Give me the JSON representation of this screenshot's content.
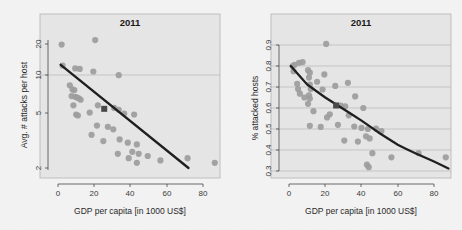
{
  "figure": {
    "background_color": "#f4f4f4",
    "panel_fill": "#e7e7e7",
    "point_color": "#9e9e9e",
    "trend_color": "#1f1f1f",
    "marker_color": "#4a4a4a",
    "grid_color": "#b9b9b9"
  },
  "chart_data": [
    {
      "id": "left",
      "type": "scatter",
      "title": "2011",
      "xlabel": "GDP per capita [in 1000 US$]",
      "ylabel": "Avg. # attacks per host",
      "xlim": [
        -4,
        92
      ],
      "ylim": [
        1.7,
        24
      ],
      "yscale": "log",
      "xscale": "linear",
      "xticks": [
        0,
        20,
        40,
        60,
        80
      ],
      "xticklabels": [
        "0",
        "20",
        "40",
        "60",
        "80"
      ],
      "yticks": [
        2,
        5,
        10,
        20
      ],
      "yticklabels": [
        "2",
        "5",
        "10",
        "20"
      ],
      "grid": "y-gridline at 10 only",
      "legend": "none",
      "points": [
        {
          "x": 2.0,
          "y": 19.8
        },
        {
          "x": 20.5,
          "y": 21.5
        },
        {
          "x": 2.5,
          "y": 13.4
        },
        {
          "x": 9.5,
          "y": 12.7
        },
        {
          "x": 12.0,
          "y": 12.6
        },
        {
          "x": 19.5,
          "y": 12.0
        },
        {
          "x": 33.5,
          "y": 11.2
        },
        {
          "x": 6.5,
          "y": 9.3
        },
        {
          "x": 8.0,
          "y": 8.6
        },
        {
          "x": 9.0,
          "y": 8.5
        },
        {
          "x": 7.5,
          "y": 7.6
        },
        {
          "x": 9.5,
          "y": 7.5
        },
        {
          "x": 10.5,
          "y": 7.4
        },
        {
          "x": 11.5,
          "y": 7.3
        },
        {
          "x": 8.5,
          "y": 6.4
        },
        {
          "x": 12.5,
          "y": 7.1
        },
        {
          "x": 10.0,
          "y": 5.4
        },
        {
          "x": 11.0,
          "y": 5.3
        },
        {
          "x": 17.5,
          "y": 5.6
        },
        {
          "x": 22.0,
          "y": 6.4
        },
        {
          "x": 31.0,
          "y": 6.1
        },
        {
          "x": 33.5,
          "y": 5.9
        },
        {
          "x": 36.5,
          "y": 5.5
        },
        {
          "x": 42.0,
          "y": 5.4
        },
        {
          "x": 21.5,
          "y": 4.4
        },
        {
          "x": 27.5,
          "y": 4.3
        },
        {
          "x": 30.5,
          "y": 4.1
        },
        {
          "x": 18.5,
          "y": 3.7
        },
        {
          "x": 25.0,
          "y": 3.3
        },
        {
          "x": 34.0,
          "y": 3.4
        },
        {
          "x": 38.5,
          "y": 3.2
        },
        {
          "x": 43.5,
          "y": 3.1
        },
        {
          "x": 41.0,
          "y": 2.7
        },
        {
          "x": 44.5,
          "y": 2.6
        },
        {
          "x": 33.0,
          "y": 2.6
        },
        {
          "x": 39.0,
          "y": 2.4
        },
        {
          "x": 43.5,
          "y": 2.2
        },
        {
          "x": 49.5,
          "y": 2.5
        },
        {
          "x": 56.5,
          "y": 2.3
        },
        {
          "x": 71.5,
          "y": 2.4
        },
        {
          "x": 86.5,
          "y": 2.2
        }
      ],
      "highlight_point": {
        "x": 25.5,
        "y": 6.0,
        "style": "filled-square"
      },
      "trend": {
        "form": "linear-on-log-y",
        "endpoints": [
          {
            "x": 1.5,
            "y": 13.6
          },
          {
            "x": 72.0,
            "y": 2.0
          }
        ]
      }
    },
    {
      "id": "right",
      "type": "scatter",
      "title": "2011",
      "xlabel": "GDP per capita [in 1000 US$]",
      "ylabel": "% attacked hosts",
      "xlim": [
        -4,
        92
      ],
      "ylim": [
        0.285,
        0.925
      ],
      "yscale": "linear",
      "xscale": "linear",
      "xticks": [
        0,
        20,
        40,
        60,
        80
      ],
      "xticklabels": [
        "0",
        "20",
        "40",
        "60",
        "80"
      ],
      "yticks": [
        0.3,
        0.4,
        0.5,
        0.6,
        0.7,
        0.8,
        0.9
      ],
      "yticklabels": [
        "0.3",
        "0.4",
        "0.5",
        "0.6",
        "0.7",
        "0.8",
        "0.9"
      ],
      "grid": "horizontal gridlines at every y tick",
      "legend": "none",
      "points": [
        {
          "x": 20.5,
          "y": 0.905
        },
        {
          "x": 2.0,
          "y": 0.8
        },
        {
          "x": 3.0,
          "y": 0.805
        },
        {
          "x": 5.5,
          "y": 0.815
        },
        {
          "x": 7.5,
          "y": 0.818
        },
        {
          "x": 2.5,
          "y": 0.775
        },
        {
          "x": 10.5,
          "y": 0.78
        },
        {
          "x": 11.5,
          "y": 0.768
        },
        {
          "x": 19.5,
          "y": 0.76
        },
        {
          "x": 11.0,
          "y": 0.745
        },
        {
          "x": 15.5,
          "y": 0.725
        },
        {
          "x": 4.5,
          "y": 0.715
        },
        {
          "x": 11.5,
          "y": 0.712
        },
        {
          "x": 25.5,
          "y": 0.705
        },
        {
          "x": 32.5,
          "y": 0.72
        },
        {
          "x": 5.0,
          "y": 0.69
        },
        {
          "x": 12.0,
          "y": 0.69
        },
        {
          "x": 18.5,
          "y": 0.688
        },
        {
          "x": 6.0,
          "y": 0.668
        },
        {
          "x": 11.0,
          "y": 0.66
        },
        {
          "x": 8.5,
          "y": 0.65
        },
        {
          "x": 11.5,
          "y": 0.645
        },
        {
          "x": 36.5,
          "y": 0.655
        },
        {
          "x": 10.5,
          "y": 0.62
        },
        {
          "x": 28.5,
          "y": 0.612
        },
        {
          "x": 31.0,
          "y": 0.608
        },
        {
          "x": 41.0,
          "y": 0.6
        },
        {
          "x": 13.5,
          "y": 0.585
        },
        {
          "x": 22.5,
          "y": 0.57
        },
        {
          "x": 33.0,
          "y": 0.565
        },
        {
          "x": 21.0,
          "y": 0.555
        },
        {
          "x": 11.5,
          "y": 0.515
        },
        {
          "x": 17.5,
          "y": 0.51
        },
        {
          "x": 27.0,
          "y": 0.52
        },
        {
          "x": 36.0,
          "y": 0.512
        },
        {
          "x": 40.0,
          "y": 0.505
        },
        {
          "x": 43.5,
          "y": 0.5
        },
        {
          "x": 48.0,
          "y": 0.502
        },
        {
          "x": 51.0,
          "y": 0.49
        },
        {
          "x": 30.5,
          "y": 0.445
        },
        {
          "x": 38.0,
          "y": 0.44
        },
        {
          "x": 42.5,
          "y": 0.465
        },
        {
          "x": 44.5,
          "y": 0.455
        },
        {
          "x": 46.0,
          "y": 0.385
        },
        {
          "x": 56.5,
          "y": 0.365
        },
        {
          "x": 71.5,
          "y": 0.385
        },
        {
          "x": 86.5,
          "y": 0.365
        },
        {
          "x": 43.0,
          "y": 0.33
        },
        {
          "x": 44.0,
          "y": 0.318
        }
      ],
      "highlight_point": {
        "x": 26.0,
        "y": 0.612,
        "style": "filled-square"
      },
      "trend": {
        "form": "decaying-curve",
        "points": [
          {
            "x": 1.0,
            "y": 0.8
          },
          {
            "x": 10.0,
            "y": 0.712
          },
          {
            "x": 20.0,
            "y": 0.65
          },
          {
            "x": 30.0,
            "y": 0.595
          },
          {
            "x": 40.0,
            "y": 0.54
          },
          {
            "x": 50.0,
            "y": 0.48
          },
          {
            "x": 60.0,
            "y": 0.425
          },
          {
            "x": 70.0,
            "y": 0.383
          },
          {
            "x": 80.0,
            "y": 0.345
          },
          {
            "x": 88.0,
            "y": 0.312
          }
        ]
      }
    }
  ]
}
